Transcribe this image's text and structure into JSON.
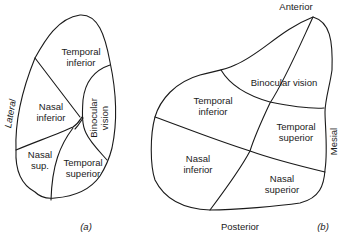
{
  "figure_a": {
    "caption": "(a)",
    "side_label": "Lateral",
    "regions": {
      "temporal_inferior": [
        "Temporal",
        "inferior"
      ],
      "nasal_inferior": [
        "Nasal",
        "inferior"
      ],
      "binocular_vision": [
        "Binocular",
        "vision"
      ],
      "nasal_sup": [
        "Nasal",
        "sup."
      ],
      "temporal_superior": [
        "Temporal",
        "superior"
      ]
    }
  },
  "figure_b": {
    "caption": "(b)",
    "top_label": "Anterior",
    "bottom_label": "Posterior",
    "side_label": "Mesial",
    "regions": {
      "binocular_vision": "Binocular vision",
      "temporal_inferior": [
        "Temporal",
        "inferior"
      ],
      "temporal_superior": [
        "Temporal",
        "superior"
      ],
      "nasal_inferior": [
        "Nasal",
        "inferior"
      ],
      "nasal_superior": [
        "Nasal",
        "superior"
      ]
    }
  },
  "colors": {
    "line": "#1a1a1a",
    "background": "#ffffff"
  }
}
